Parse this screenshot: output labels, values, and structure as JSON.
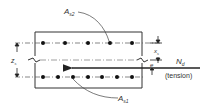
{
  "diagram": {
    "labels": {
      "top_steel": "A",
      "top_steel_sub": "s2",
      "bottom_steel": "A",
      "bottom_steel_sub": "s1",
      "lever_arm": "z",
      "lever_arm_sub": "s",
      "centroid_offset": "x",
      "centroid_offset_sub": "s",
      "eccentricity": "e",
      "force": "N",
      "force_sub": "d",
      "force_note": "(tension)"
    },
    "top_bar_count": 5,
    "bottom_bar_count": 7,
    "colors": {
      "line": "#333333",
      "dash": "#555555",
      "background": "#ffffff"
    }
  }
}
